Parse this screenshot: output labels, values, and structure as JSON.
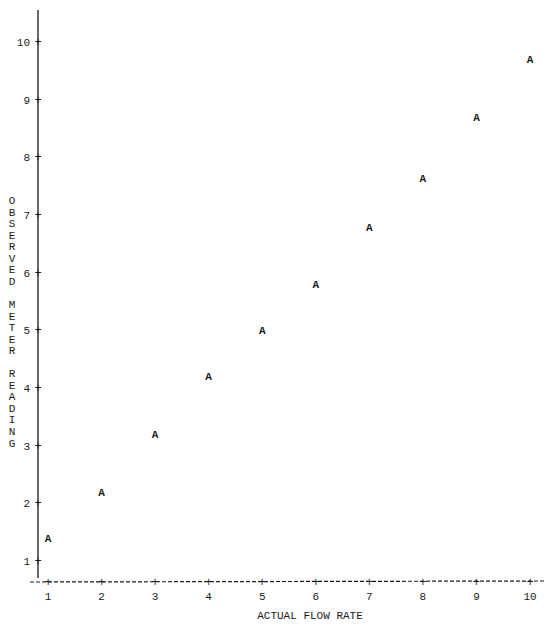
{
  "chart_data": {
    "type": "scatter",
    "title": "",
    "xlabel": "ACTUAL FLOW RATE",
    "ylabel": "OBSERVED METER READING",
    "plot_symbol": "A",
    "x_ticks": [
      "1",
      "2",
      "3",
      "4",
      "5",
      "6",
      "7",
      "8",
      "9",
      "10"
    ],
    "y_ticks": [
      "1",
      "2",
      "3",
      "4",
      "5",
      "6",
      "7",
      "8",
      "9",
      "10"
    ],
    "xlim": [
      1,
      10
    ],
    "ylim": [
      1,
      10
    ],
    "grid": false,
    "legend": "none",
    "points": [
      {
        "x": 1,
        "y": 1.4
      },
      {
        "x": 2,
        "y": 2.2
      },
      {
        "x": 3,
        "y": 3.2
      },
      {
        "x": 4,
        "y": 4.2
      },
      {
        "x": 5,
        "y": 5.0
      },
      {
        "x": 6,
        "y": 5.8
      },
      {
        "x": 7,
        "y": 6.8
      },
      {
        "x": 8,
        "y": 7.65
      },
      {
        "x": 9,
        "y": 8.7
      },
      {
        "x": 10,
        "y": 9.7
      }
    ]
  }
}
